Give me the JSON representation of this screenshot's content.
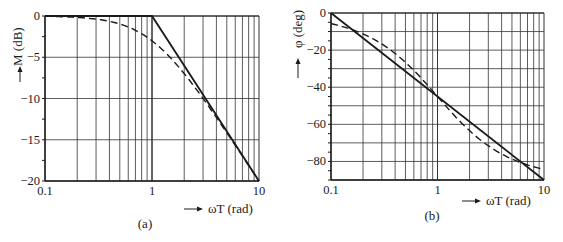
{
  "chart_data": [
    {
      "id": "a",
      "type": "line",
      "caption": "(a)",
      "title": "",
      "xlabel": "ωT (rad)",
      "ylabel": "M (dB)",
      "xscale": "log",
      "xlim": [
        0.1,
        10
      ],
      "ylim": [
        -20,
        0
      ],
      "xticks": [
        0.1,
        1,
        10
      ],
      "xtick_labels": [
        "0.1",
        "1",
        "10"
      ],
      "yticks": [
        0,
        -5,
        -10,
        -15,
        -20
      ],
      "ytick_labels": [
        "0",
        "−5",
        "−10",
        "−15",
        "−20"
      ],
      "grid": true,
      "series": [
        {
          "name": "asymptote",
          "style": "solid",
          "x": [
            0.1,
            1,
            10
          ],
          "y": [
            0,
            0,
            -20
          ]
        },
        {
          "name": "exact",
          "style": "dashed",
          "x": [
            0.1,
            0.2,
            0.3,
            0.5,
            0.7,
            1,
            1.5,
            2,
            3,
            5,
            7,
            10
          ],
          "y": [
            -0.04,
            -0.17,
            -0.37,
            -0.97,
            -1.73,
            -3.01,
            -5.12,
            -6.99,
            -10.0,
            -14.15,
            -16.99,
            -20.04
          ]
        }
      ]
    },
    {
      "id": "b",
      "type": "line",
      "caption": "(b)",
      "title": "",
      "xlabel": "ωT (rad)",
      "ylabel": "φ (deg)",
      "xscale": "log",
      "xlim": [
        0.1,
        10
      ],
      "ylim": [
        -90,
        0
      ],
      "xticks": [
        0.1,
        1,
        10
      ],
      "xtick_labels": [
        "0.1",
        "1",
        "10"
      ],
      "yticks": [
        0,
        -20,
        -40,
        -60,
        -80
      ],
      "ytick_labels": [
        "0",
        "−20",
        "−40",
        "−60",
        "−80"
      ],
      "grid": true,
      "series": [
        {
          "name": "asymptote",
          "style": "solid",
          "x": [
            0.1,
            10
          ],
          "y": [
            0,
            -90
          ]
        },
        {
          "name": "exact",
          "style": "dashed",
          "x": [
            0.1,
            0.2,
            0.3,
            0.5,
            0.7,
            1,
            1.5,
            2,
            3,
            5,
            7,
            10
          ],
          "y": [
            -5.7,
            -11.3,
            -16.7,
            -26.6,
            -35.0,
            -45.0,
            -56.3,
            -63.4,
            -71.6,
            -78.7,
            -81.9,
            -84.3
          ]
        }
      ]
    }
  ],
  "labels": {
    "a_ylabel": "M (dB)",
    "a_xlabel": "ωT (rad)",
    "a_caption": "(a)",
    "b_ylabel": "φ (deg)",
    "b_xlabel": "ωT (rad)",
    "b_caption": "(b)"
  },
  "colors": {
    "ink": "#1a1a1a",
    "grid": "#333333"
  }
}
